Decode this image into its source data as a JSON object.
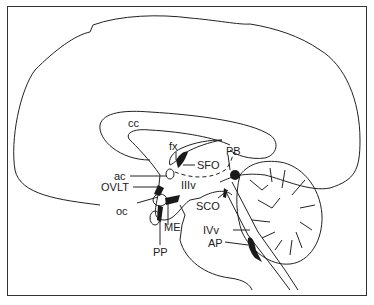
{
  "diagram": {
    "type": "sagittal brain section",
    "labels": {
      "cc": "cc",
      "fx": "fx",
      "sfo": "SFO",
      "pb": "PB",
      "ac": "ac",
      "iiiv": "IIIv",
      "ovlt": "OVLT",
      "oc": "oc",
      "sco": "SCO",
      "me": "ME",
      "ivv": "IVv",
      "ap": "AP",
      "pp": "PP"
    },
    "colors": {
      "line": "#222222",
      "fill_dark": "#1a1a1a",
      "background": "#ffffff"
    }
  }
}
